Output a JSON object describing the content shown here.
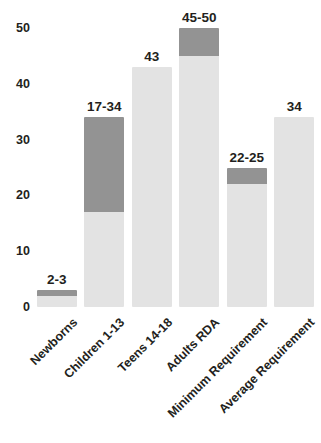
{
  "chart_data": {
    "type": "bar",
    "title": "",
    "title_note": "title cropped off top edge of screenshot",
    "xlabel": "",
    "ylabel": "",
    "ylim": [
      0,
      50
    ],
    "yticks": [
      0,
      10,
      20,
      30,
      40,
      50
    ],
    "ytick_labels": [
      "0",
      "10",
      "20",
      "30",
      "40",
      "50"
    ],
    "grid": false,
    "legend": "none",
    "orientation": "vertical",
    "categories": [
      "Newborns",
      "Children 1-13",
      "Teens 14-18",
      "Adults RDA",
      "Minimum Requirement",
      "Average Requirement"
    ],
    "values": [
      3,
      34,
      43,
      50,
      25,
      34
    ],
    "range_low": [
      2,
      17,
      43,
      45,
      22,
      34
    ],
    "range_high": [
      3,
      34,
      43,
      50,
      25,
      34
    ],
    "data_labels": [
      "2-3",
      "17-34",
      "43",
      "45-50",
      "22-25",
      "34"
    ],
    "bars": [
      {
        "category": "Newborns",
        "label": "2-3",
        "low": 2,
        "high": 3,
        "is_range": true
      },
      {
        "category": "Children 1-13",
        "label": "17-34",
        "low": 17,
        "high": 34,
        "is_range": true
      },
      {
        "category": "Teens 14-18",
        "label": "43",
        "low": 43,
        "high": 43,
        "is_range": false
      },
      {
        "category": "Adults RDA",
        "label": "45-50",
        "low": 45,
        "high": 50,
        "is_range": true
      },
      {
        "category": "Minimum Requirement",
        "label": "22-25",
        "low": 22,
        "high": 25,
        "is_range": true
      },
      {
        "category": "Average Requirement",
        "label": "34",
        "low": 34,
        "high": 34,
        "is_range": false
      }
    ],
    "colors": {
      "range_upper": "#939393",
      "bar_base": "#e3e3e3",
      "text": "#231f20",
      "background": "#ffffff"
    }
  }
}
